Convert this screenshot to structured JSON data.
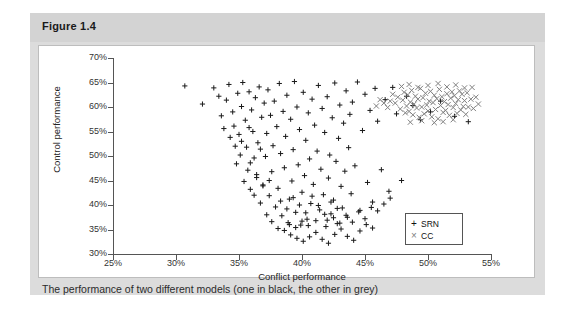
{
  "figure": {
    "title": "Figure 1.4",
    "caption": "The performance of two different models (one in black, the other in grey)"
  },
  "chart_data": {
    "type": "scatter",
    "title": "",
    "xlabel": "Conflict performance",
    "ylabel": "Control performance",
    "xlim": [
      25,
      55
    ],
    "ylim": [
      30,
      70
    ],
    "xticks": [
      "25%",
      "30%",
      "35%",
      "40%",
      "45%",
      "50%",
      "55%"
    ],
    "yticks": [
      "30%",
      "35%",
      "40%",
      "45%",
      "50%",
      "55%",
      "60%",
      "65%",
      "70%"
    ],
    "xtick_values": [
      25,
      30,
      35,
      40,
      45,
      50,
      55
    ],
    "ytick_values": [
      30,
      35,
      40,
      45,
      50,
      55,
      60,
      65,
      70
    ],
    "grid": false,
    "legend_position": "bottom-right-inside",
    "series": [
      {
        "name": "SRN",
        "marker": "+",
        "color": "#1a1a1a",
        "points": [
          [
            30.7,
            64.3
          ],
          [
            32.1,
            60.6
          ],
          [
            33.0,
            63.9
          ],
          [
            33.4,
            62.2
          ],
          [
            33.6,
            58.2
          ],
          [
            34.0,
            61.4
          ],
          [
            34.2,
            64.6
          ],
          [
            34.5,
            59.0
          ],
          [
            34.6,
            56.1
          ],
          [
            34.9,
            62.8
          ],
          [
            35.0,
            54.4
          ],
          [
            35.2,
            60.1
          ],
          [
            35.3,
            65.0
          ],
          [
            35.5,
            57.3
          ],
          [
            35.6,
            51.8
          ],
          [
            35.8,
            63.1
          ],
          [
            35.9,
            48.6
          ],
          [
            36.0,
            59.4
          ],
          [
            36.1,
            55.0
          ],
          [
            36.3,
            61.9
          ],
          [
            36.4,
            46.2
          ],
          [
            36.5,
            52.7
          ],
          [
            36.6,
            64.1
          ],
          [
            36.8,
            57.9
          ],
          [
            36.9,
            44.1
          ],
          [
            37.0,
            60.8
          ],
          [
            37.1,
            49.9
          ],
          [
            37.2,
            54.6
          ],
          [
            37.3,
            63.5
          ],
          [
            37.4,
            41.9
          ],
          [
            37.5,
            58.3
          ],
          [
            37.6,
            46.8
          ],
          [
            37.7,
            52.1
          ],
          [
            37.8,
            61.2
          ],
          [
            37.9,
            39.6
          ],
          [
            38.0,
            56.0
          ],
          [
            38.1,
            43.4
          ],
          [
            38.2,
            64.8
          ],
          [
            38.3,
            50.5
          ],
          [
            38.4,
            37.8
          ],
          [
            38.5,
            59.1
          ],
          [
            38.6,
            47.6
          ],
          [
            38.7,
            54.0
          ],
          [
            38.8,
            62.4
          ],
          [
            38.9,
            36.4
          ],
          [
            39.0,
            41.2
          ],
          [
            39.1,
            57.5
          ],
          [
            39.2,
            44.9
          ],
          [
            39.3,
            51.3
          ],
          [
            39.4,
            65.2
          ],
          [
            39.5,
            38.5
          ],
          [
            39.6,
            60.0
          ],
          [
            39.7,
            48.2
          ],
          [
            39.8,
            55.4
          ],
          [
            39.9,
            35.9
          ],
          [
            40.0,
            42.6
          ],
          [
            40.1,
            63.0
          ],
          [
            40.2,
            46.0
          ],
          [
            40.3,
            53.2
          ],
          [
            40.4,
            37.1
          ],
          [
            40.5,
            58.8
          ],
          [
            40.6,
            49.4
          ],
          [
            40.7,
            40.3
          ],
          [
            40.8,
            61.6
          ],
          [
            40.9,
            44.2
          ],
          [
            41.0,
            56.3
          ],
          [
            41.1,
            36.8
          ],
          [
            41.2,
            51.0
          ],
          [
            41.3,
            64.4
          ],
          [
            41.4,
            39.0
          ],
          [
            41.5,
            47.3
          ],
          [
            41.6,
            59.7
          ],
          [
            41.7,
            42.1
          ],
          [
            41.8,
            54.8
          ],
          [
            41.9,
            35.6
          ],
          [
            42.0,
            62.1
          ],
          [
            42.1,
            45.5
          ],
          [
            42.2,
            50.2
          ],
          [
            42.3,
            38.2
          ],
          [
            42.4,
            57.8
          ],
          [
            42.5,
            41.0
          ],
          [
            42.6,
            64.9
          ],
          [
            42.7,
            48.9
          ],
          [
            42.8,
            36.2
          ],
          [
            42.9,
            53.6
          ],
          [
            43.0,
            60.4
          ],
          [
            43.1,
            43.8
          ],
          [
            43.2,
            39.4
          ],
          [
            43.3,
            56.7
          ],
          [
            43.4,
            46.9
          ],
          [
            43.5,
            63.3
          ],
          [
            43.6,
            37.5
          ],
          [
            43.7,
            51.7
          ],
          [
            43.8,
            58.5
          ],
          [
            43.9,
            42.3
          ],
          [
            44.0,
            61.0
          ],
          [
            44.2,
            48.0
          ],
          [
            44.4,
            65.1
          ],
          [
            44.6,
            38.9
          ],
          [
            44.8,
            55.2
          ],
          [
            45.0,
            62.6
          ],
          [
            45.2,
            44.6
          ],
          [
            45.4,
            59.3
          ],
          [
            45.6,
            40.6
          ],
          [
            45.8,
            63.8
          ],
          [
            46.0,
            57.1
          ],
          [
            46.3,
            47.2
          ],
          [
            46.6,
            61.5
          ],
          [
            46.9,
            42.8
          ],
          [
            47.2,
            64.0
          ],
          [
            47.5,
            58.6
          ],
          [
            47.9,
            45.0
          ],
          [
            48.3,
            62.2
          ],
          [
            48.8,
            60.3
          ],
          [
            49.4,
            57.4
          ],
          [
            50.2,
            59.0
          ],
          [
            51.0,
            61.2
          ],
          [
            52.1,
            58.1
          ],
          [
            53.2,
            57.0
          ],
          [
            36.2,
            42.0
          ],
          [
            36.7,
            40.4
          ],
          [
            37.2,
            38.0
          ],
          [
            37.6,
            36.6
          ],
          [
            38.1,
            35.2
          ],
          [
            38.6,
            34.8
          ],
          [
            39.1,
            33.9
          ],
          [
            39.6,
            33.2
          ],
          [
            40.1,
            32.6
          ],
          [
            40.6,
            33.5
          ],
          [
            41.1,
            34.4
          ],
          [
            41.6,
            33.0
          ],
          [
            42.1,
            32.2
          ],
          [
            42.6,
            34.0
          ],
          [
            43.1,
            35.1
          ],
          [
            43.6,
            33.6
          ],
          [
            44.1,
            32.8
          ],
          [
            44.6,
            34.7
          ],
          [
            45.1,
            36.0
          ],
          [
            45.6,
            35.3
          ],
          [
            38.3,
            40.8
          ],
          [
            38.8,
            39.2
          ],
          [
            39.3,
            41.5
          ],
          [
            39.8,
            40.0
          ],
          [
            40.3,
            38.4
          ],
          [
            40.8,
            41.8
          ],
          [
            41.3,
            39.9
          ],
          [
            41.8,
            38.1
          ],
          [
            42.3,
            40.6
          ],
          [
            42.8,
            39.3
          ],
          [
            35.4,
            44.8
          ],
          [
            35.9,
            43.2
          ],
          [
            36.4,
            45.6
          ],
          [
            36.9,
            43.9
          ],
          [
            37.4,
            45.0
          ],
          [
            34.8,
            48.4
          ],
          [
            35.1,
            50.2
          ],
          [
            35.7,
            47.1
          ],
          [
            36.2,
            49.6
          ],
          [
            36.7,
            51.4
          ],
          [
            33.8,
            55.6
          ],
          [
            34.3,
            53.8
          ],
          [
            34.7,
            52.0
          ],
          [
            35.2,
            53.0
          ],
          [
            35.8,
            55.8
          ],
          [
            42.0,
            36.9
          ],
          [
            42.5,
            37.4
          ],
          [
            43.0,
            36.3
          ],
          [
            43.5,
            37.9
          ],
          [
            44.0,
            36.5
          ],
          [
            44.5,
            38.6
          ],
          [
            45.0,
            37.2
          ],
          [
            45.5,
            39.5
          ],
          [
            46.0,
            38.8
          ],
          [
            46.5,
            40.2
          ],
          [
            47.0,
            41.4
          ],
          [
            39.0,
            36.0
          ],
          [
            39.5,
            35.4
          ],
          [
            40.0,
            36.7
          ],
          [
            40.5,
            35.8
          ]
        ]
      },
      {
        "name": "CC",
        "marker": "x",
        "color": "#808080",
        "points": [
          [
            47.4,
            60.8
          ],
          [
            47.6,
            62.0
          ],
          [
            47.8,
            59.6
          ],
          [
            48.0,
            61.4
          ],
          [
            48.1,
            63.0
          ],
          [
            48.2,
            58.8
          ],
          [
            48.3,
            60.2
          ],
          [
            48.4,
            62.5
          ],
          [
            48.5,
            59.1
          ],
          [
            48.6,
            61.0
          ],
          [
            48.7,
            63.4
          ],
          [
            48.8,
            58.4
          ],
          [
            48.9,
            60.6
          ],
          [
            49.0,
            62.2
          ],
          [
            49.1,
            59.8
          ],
          [
            49.2,
            61.6
          ],
          [
            49.3,
            57.9
          ],
          [
            49.4,
            63.8
          ],
          [
            49.5,
            60.0
          ],
          [
            49.6,
            61.9
          ],
          [
            49.7,
            58.6
          ],
          [
            49.8,
            62.8
          ],
          [
            49.9,
            60.4
          ],
          [
            50.0,
            59.2
          ],
          [
            50.1,
            61.2
          ],
          [
            50.2,
            63.2
          ],
          [
            50.3,
            58.0
          ],
          [
            50.4,
            60.9
          ],
          [
            50.5,
            62.4
          ],
          [
            50.6,
            59.5
          ],
          [
            50.7,
            61.7
          ],
          [
            50.8,
            57.6
          ],
          [
            50.9,
            63.6
          ],
          [
            51.0,
            60.3
          ],
          [
            51.1,
            62.1
          ],
          [
            51.2,
            58.9
          ],
          [
            51.3,
            61.1
          ],
          [
            51.4,
            59.3
          ],
          [
            51.5,
            62.7
          ],
          [
            51.6,
            60.5
          ],
          [
            51.7,
            58.3
          ],
          [
            51.8,
            61.8
          ],
          [
            51.9,
            63.1
          ],
          [
            52.0,
            59.9
          ],
          [
            52.1,
            62.3
          ],
          [
            52.2,
            60.7
          ],
          [
            52.3,
            58.7
          ],
          [
            52.4,
            61.5
          ],
          [
            52.5,
            63.3
          ],
          [
            52.6,
            59.4
          ],
          [
            52.7,
            62.6
          ],
          [
            52.8,
            60.1
          ],
          [
            52.9,
            61.3
          ],
          [
            53.0,
            58.5
          ],
          [
            53.1,
            62.9
          ],
          [
            53.2,
            60.0
          ],
          [
            53.4,
            61.6
          ],
          [
            53.6,
            59.7
          ],
          [
            53.8,
            62.0
          ],
          [
            54.0,
            60.6
          ],
          [
            47.9,
            64.2
          ],
          [
            48.5,
            64.6
          ],
          [
            49.2,
            64.0
          ],
          [
            50.0,
            64.4
          ],
          [
            50.8,
            64.8
          ],
          [
            51.5,
            64.1
          ],
          [
            52.2,
            64.5
          ],
          [
            52.9,
            63.9
          ],
          [
            47.2,
            62.6
          ],
          [
            47.0,
            61.2
          ],
          [
            46.8,
            59.9
          ],
          [
            46.5,
            60.8
          ],
          [
            46.2,
            61.5
          ],
          [
            45.9,
            60.2
          ],
          [
            53.5,
            64.0
          ],
          [
            49.5,
            57.2
          ],
          [
            50.5,
            56.8
          ],
          [
            51.2,
            57.0
          ],
          [
            52.0,
            57.4
          ],
          [
            48.6,
            56.9
          ]
        ]
      }
    ]
  },
  "legend": {
    "entries": [
      {
        "marker": "+",
        "label": "SRN"
      },
      {
        "marker": "×",
        "label": "CC"
      }
    ]
  }
}
